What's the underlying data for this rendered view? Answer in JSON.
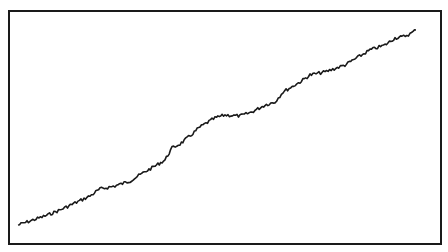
{
  "chart_data": {
    "type": "line",
    "title": "",
    "xlabel": "",
    "ylabel": "",
    "grid": false,
    "legend": null,
    "axis_ticks_visible": false,
    "series": [
      {
        "name": "series",
        "color": "#1a1a1a",
        "points_px": [
          [
            18,
            225
          ],
          [
            30,
            221
          ],
          [
            45,
            216
          ],
          [
            60,
            210
          ],
          [
            75,
            203
          ],
          [
            90,
            196
          ],
          [
            100,
            189
          ],
          [
            115,
            186
          ],
          [
            130,
            181
          ],
          [
            143,
            173
          ],
          [
            155,
            166
          ],
          [
            165,
            160
          ],
          [
            172,
            148
          ],
          [
            180,
            144
          ],
          [
            190,
            136
          ],
          [
            200,
            127
          ],
          [
            215,
            118
          ],
          [
            225,
            115
          ],
          [
            240,
            116
          ],
          [
            252,
            112
          ],
          [
            265,
            105
          ],
          [
            275,
            102
          ],
          [
            283,
            92
          ],
          [
            300,
            82
          ],
          [
            310,
            75
          ],
          [
            325,
            72
          ],
          [
            345,
            65
          ],
          [
            355,
            59
          ],
          [
            370,
            50
          ],
          [
            385,
            45
          ],
          [
            395,
            38
          ],
          [
            402,
            37
          ],
          [
            410,
            34
          ],
          [
            416,
            30
          ]
        ]
      }
    ],
    "x_range_px": [
      8,
      442
    ],
    "y_range_px": [
      10,
      245
    ]
  },
  "style": {
    "frame_color": "#1a1a1a",
    "background": "#ffffff",
    "line_color": "#1a1a1a"
  }
}
